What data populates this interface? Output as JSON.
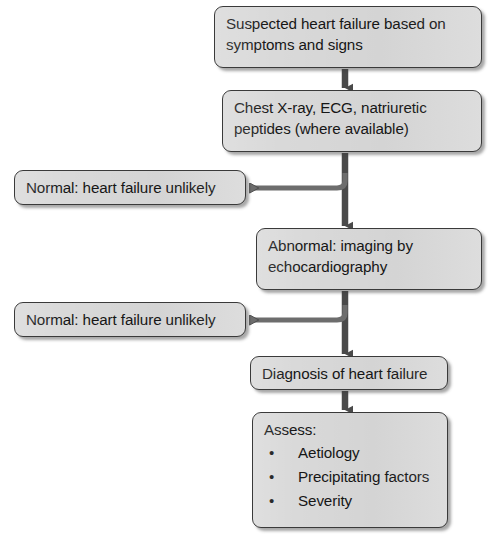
{
  "diagram": {
    "type": "flowchart",
    "colors": {
      "node_fill": "#d9d9d9",
      "node_border": "#3a3a3a",
      "connector": "#4a4a4a",
      "text": "#161616",
      "background": "#ffffff"
    },
    "nodes": {
      "suspected": {
        "line1": "Suspected heart failure based on",
        "line2": "symptoms and signs"
      },
      "tests": {
        "line1": "Chest X-ray, ECG, natriuretic",
        "line2": "peptides (where available)"
      },
      "normal_1": {
        "line1": "Normal: heart failure unlikely"
      },
      "abnormal": {
        "line1": "Abnormal: imaging by",
        "line2": "echocardiography"
      },
      "normal_2": {
        "line1": "Normal: heart failure unlikely"
      },
      "diagnosis": {
        "line1": "Diagnosis of heart failure"
      },
      "assess": {
        "title": "Assess:",
        "bullet_glyph": "•",
        "items": [
          "Aetiology",
          "Precipitating factors",
          "Severity"
        ]
      }
    },
    "edges": [
      {
        "from": "suspected",
        "to": "tests",
        "direction": "down",
        "style": "solid-arrow"
      },
      {
        "from": "tests",
        "to": "abnormal",
        "direction": "down",
        "style": "solid-arrow"
      },
      {
        "from": "tests",
        "to": "normal_1",
        "direction": "left",
        "style": "elbow-arrow"
      },
      {
        "from": "abnormal",
        "to": "diagnosis",
        "direction": "down",
        "style": "solid-arrow"
      },
      {
        "from": "abnormal",
        "to": "normal_2",
        "direction": "left",
        "style": "elbow-arrow"
      },
      {
        "from": "diagnosis",
        "to": "assess",
        "direction": "down",
        "style": "solid-arrow"
      }
    ]
  }
}
